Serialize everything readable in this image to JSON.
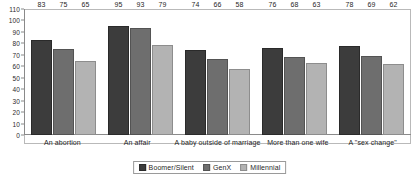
{
  "chart_data": {
    "type": "bar",
    "title": "",
    "subtitle": "",
    "xlabel": "",
    "ylabel": "",
    "ylim": [
      0,
      110
    ],
    "ytick_step": 10,
    "yticks": [
      110,
      100,
      90,
      80,
      70,
      60,
      50,
      40,
      30,
      20,
      10,
      0
    ],
    "grid": false,
    "legend_position": "bottom-center",
    "categories": [
      "An abortion",
      "An affair",
      "A baby outside of marriage",
      "More than one wife",
      "A \"sex change\""
    ],
    "series": [
      {
        "name": "Boomer/Silent",
        "color": "#3c3c3c",
        "values": [
          83,
          95,
          74,
          76,
          78
        ]
      },
      {
        "name": "GenX",
        "color": "#6e6e6e",
        "values": [
          75,
          93,
          66,
          68,
          69
        ]
      },
      {
        "name": "Millennial",
        "color": "#b3b3b3",
        "values": [
          65,
          79,
          58,
          63,
          62
        ]
      }
    ],
    "data_labels_shown": true
  },
  "colors": {
    "background": "#ffffff",
    "plot_border": "#b9b9b9",
    "axis_line": "#8a8a8a",
    "text": "#1f1f1f",
    "series_boomer_silent": "#3c3c3c",
    "series_genx": "#6e6e6e",
    "series_millennial": "#b3b3b3"
  }
}
